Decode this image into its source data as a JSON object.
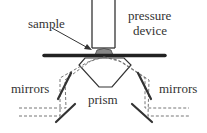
{
  "labels": {
    "sample": "sample",
    "pressure_line1": "pressure",
    "pressure_line2": "device",
    "mirrors_left": "mirrors",
    "mirrors_right": "mirrors",
    "prism": "prism"
  },
  "colors": {
    "line": "#333333",
    "sample_fill": "#888888",
    "dashed": "#777777"
  }
}
